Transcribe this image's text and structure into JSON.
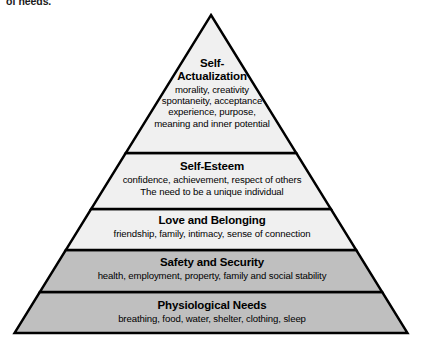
{
  "caption": {
    "tail_text": "of needs."
  },
  "diagram": {
    "type": "pyramid",
    "name": "maslow-hierarchy-of-needs",
    "apex": {
      "x": 211,
      "y": 15
    },
    "base_left": {
      "x": 14,
      "y": 333
    },
    "base_right": {
      "x": 407,
      "y": 333
    },
    "divider_y": [
      153,
      209,
      250,
      292
    ],
    "colors": {
      "outline": "#000000",
      "tier_fill_light": "#f0f0f0",
      "tier_fill_grey": "#bfbfbf",
      "text": "#000000",
      "background": "#ffffff"
    },
    "tiers": [
      {
        "id": "self-actualization",
        "title": "Self-Actualization",
        "title_lines": [
          "Self-",
          "Actualization"
        ],
        "description_lines": [
          "morality, creativity",
          "spontaneity, acceptance",
          "experience, purpose,",
          "meaning and inner potential"
        ],
        "fill": "#f0f0f0"
      },
      {
        "id": "self-esteem",
        "title": "Self-Esteem",
        "title_lines": [
          "Self-Esteem"
        ],
        "description_lines": [
          "confidence, achievement, respect of others",
          "The need to be a unique individual"
        ],
        "fill": "#f0f0f0"
      },
      {
        "id": "love-and-belonging",
        "title": "Love and Belonging",
        "title_lines": [
          "Love and Belonging"
        ],
        "description_lines": [
          "friendship, family, intimacy, sense of connection"
        ],
        "fill": "#f0f0f0"
      },
      {
        "id": "safety-and-security",
        "title": "Safety and Security",
        "title_lines": [
          "Safety and Security"
        ],
        "description_lines": [
          "health, employment, property, family and social stability"
        ],
        "fill": "#bfbfbf"
      },
      {
        "id": "physiological-needs",
        "title": "Physiological Needs",
        "title_lines": [
          "Physiological Needs"
        ],
        "description_lines": [
          "breathing, food, water, shelter, clothing, sleep"
        ],
        "fill": "#bfbfbf"
      }
    ]
  }
}
